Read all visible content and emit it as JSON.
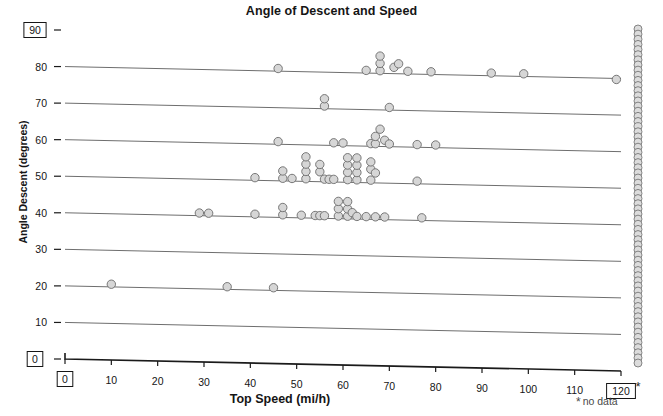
{
  "chart_data": {
    "type": "scatter",
    "title": "Angle of Descent and Speed",
    "xlabel": "Top Speed (mi/h)",
    "ylabel": "Angle Descent (degrees)",
    "xlim": [
      0,
      120
    ],
    "ylim": [
      0,
      90
    ],
    "xticks": [
      0,
      10,
      20,
      30,
      40,
      50,
      60,
      70,
      80,
      90,
      100,
      110,
      120
    ],
    "yticks": [
      0,
      10,
      20,
      30,
      40,
      50,
      60,
      70,
      80,
      90
    ],
    "xtick_labels": [
      "0",
      "10",
      "20",
      "30",
      "40",
      "50",
      "60",
      "70",
      "80",
      "90",
      "100",
      "110",
      "120"
    ],
    "ytick_labels": [
      "0",
      "10",
      "20",
      "30",
      "40",
      "50",
      "60",
      "70",
      "80",
      "90"
    ],
    "boxed_xticks": [
      "0",
      "120"
    ],
    "boxed_yticks": [
      "0",
      "90"
    ],
    "grid": "horizontal",
    "legend": "* no data",
    "legend_position": "bottom-right",
    "marker": "open-circle-gray",
    "points": [
      {
        "x": 10,
        "y": 21
      },
      {
        "x": 35,
        "y": 21
      },
      {
        "x": 45,
        "y": 21
      },
      {
        "x": 29,
        "y": 41
      },
      {
        "x": 31,
        "y": 41
      },
      {
        "x": 41,
        "y": 41
      },
      {
        "x": 47,
        "y": 41
      },
      {
        "x": 47,
        "y": 43
      },
      {
        "x": 51,
        "y": 41
      },
      {
        "x": 54,
        "y": 41
      },
      {
        "x": 55,
        "y": 41
      },
      {
        "x": 56,
        "y": 41
      },
      {
        "x": 59,
        "y": 41
      },
      {
        "x": 59,
        "y": 43
      },
      {
        "x": 59,
        "y": 45
      },
      {
        "x": 61,
        "y": 41
      },
      {
        "x": 61,
        "y": 43
      },
      {
        "x": 61,
        "y": 45
      },
      {
        "x": 62,
        "y": 42
      },
      {
        "x": 63,
        "y": 41
      },
      {
        "x": 65,
        "y": 41
      },
      {
        "x": 67,
        "y": 41
      },
      {
        "x": 69,
        "y": 41
      },
      {
        "x": 77,
        "y": 41
      },
      {
        "x": 41,
        "y": 51
      },
      {
        "x": 47,
        "y": 51
      },
      {
        "x": 47,
        "y": 53
      },
      {
        "x": 49,
        "y": 51
      },
      {
        "x": 52,
        "y": 51
      },
      {
        "x": 52,
        "y": 53
      },
      {
        "x": 52,
        "y": 55
      },
      {
        "x": 52,
        "y": 57
      },
      {
        "x": 55,
        "y": 53
      },
      {
        "x": 55,
        "y": 55
      },
      {
        "x": 56,
        "y": 51
      },
      {
        "x": 57,
        "y": 51
      },
      {
        "x": 58,
        "y": 51
      },
      {
        "x": 61,
        "y": 51
      },
      {
        "x": 61,
        "y": 53
      },
      {
        "x": 61,
        "y": 55
      },
      {
        "x": 61,
        "y": 57
      },
      {
        "x": 63,
        "y": 51
      },
      {
        "x": 63,
        "y": 53
      },
      {
        "x": 63,
        "y": 55
      },
      {
        "x": 63,
        "y": 57
      },
      {
        "x": 66,
        "y": 51
      },
      {
        "x": 66,
        "y": 54
      },
      {
        "x": 66,
        "y": 56
      },
      {
        "x": 67,
        "y": 53
      },
      {
        "x": 76,
        "y": 51
      },
      {
        "x": 46,
        "y": 61
      },
      {
        "x": 58,
        "y": 61
      },
      {
        "x": 60,
        "y": 61
      },
      {
        "x": 66,
        "y": 61
      },
      {
        "x": 67,
        "y": 61
      },
      {
        "x": 67,
        "y": 63
      },
      {
        "x": 68,
        "y": 65
      },
      {
        "x": 69,
        "y": 62
      },
      {
        "x": 70,
        "y": 61
      },
      {
        "x": 76,
        "y": 61
      },
      {
        "x": 80,
        "y": 61
      },
      {
        "x": 56,
        "y": 71
      },
      {
        "x": 56,
        "y": 73
      },
      {
        "x": 70,
        "y": 71
      },
      {
        "x": 46,
        "y": 81
      },
      {
        "x": 65,
        "y": 81
      },
      {
        "x": 68,
        "y": 81
      },
      {
        "x": 68,
        "y": 83
      },
      {
        "x": 68,
        "y": 85
      },
      {
        "x": 71,
        "y": 82
      },
      {
        "x": 72,
        "y": 83
      },
      {
        "x": 74,
        "y": 81
      },
      {
        "x": 79,
        "y": 81
      },
      {
        "x": 92,
        "y": 81
      },
      {
        "x": 99,
        "y": 81
      },
      {
        "x": 119,
        "y": 80
      }
    ],
    "nodata_column": {
      "x_label": "*",
      "note": "no data",
      "count": 66,
      "y_from": 0,
      "y_to": 90
    }
  }
}
